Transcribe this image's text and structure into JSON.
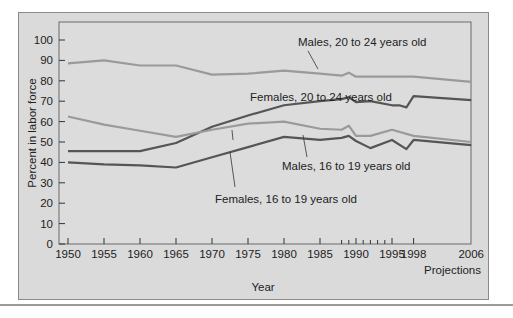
{
  "chart_data": {
    "type": "line",
    "title": "",
    "xlabel": "Year",
    "ylabel": "Percent in labor force",
    "xlabel_note": "Projections",
    "ylim": [
      0,
      100
    ],
    "yticks": [
      0,
      10,
      20,
      30,
      40,
      50,
      60,
      70,
      80,
      90,
      100
    ],
    "xticks": [
      "1950",
      "1955",
      "1960",
      "1965",
      "1970",
      "1975",
      "1980",
      "1985",
      "1990",
      "1995",
      "1998",
      "2006"
    ],
    "grid": false,
    "legend": "inline annotations",
    "series": [
      {
        "name": "Males, 20 to 24 years old",
        "color": "#9a9a9a",
        "x": [
          1950,
          1955,
          1960,
          1965,
          1970,
          1975,
          1980,
          1985,
          1988,
          1989,
          1990,
          1992,
          1995,
          1998,
          2006
        ],
        "values": [
          88.5,
          90,
          87.5,
          87.5,
          83,
          83.5,
          85,
          83.5,
          82.5,
          84,
          82,
          82,
          82,
          82,
          79.5
        ]
      },
      {
        "name": "Females, 20 to 24 years old",
        "color": "#555555",
        "x": [
          1950,
          1955,
          1960,
          1965,
          1970,
          1975,
          1980,
          1985,
          1988,
          1989,
          1990,
          1992,
          1995,
          1996,
          1997,
          1998,
          2006
        ],
        "values": [
          45.5,
          45.5,
          45.5,
          49.5,
          57.5,
          63,
          68,
          70,
          71,
          72,
          69.5,
          70,
          68,
          68,
          67,
          72.5,
          70.5
        ]
      },
      {
        "name": "Males, 16 to 19 years old",
        "color": "#9a9a9a",
        "x": [
          1950,
          1955,
          1960,
          1965,
          1970,
          1975,
          1980,
          1985,
          1988,
          1989,
          1990,
          1992,
          1995,
          1998,
          2006
        ],
        "values": [
          62.5,
          58.5,
          55.5,
          52.5,
          56,
          59,
          60,
          56.5,
          56,
          58,
          53,
          53,
          56,
          53,
          50
        ]
      },
      {
        "name": "Females, 16 to 19 years old",
        "color": "#555555",
        "x": [
          1950,
          1955,
          1960,
          1965,
          1970,
          1975,
          1980,
          1985,
          1988,
          1989,
          1990,
          1992,
          1995,
          1997,
          1998,
          2006
        ],
        "values": [
          40,
          39,
          38.5,
          37.5,
          42.5,
          47.5,
          52.5,
          51,
          52,
          53,
          50.5,
          47,
          51,
          46.5,
          51,
          48.5
        ]
      }
    ]
  },
  "labels": {
    "ylabel": "Percent in labor force",
    "xlabel": "Year",
    "projections": "Projections",
    "males_20_24": "Males, 20 to 24 years old",
    "females_20_24": "Females, 20 to 24 years old",
    "males_16_19": "Males, 16 to 19 years old",
    "females_16_19": "Females, 16 to 19 years old"
  }
}
